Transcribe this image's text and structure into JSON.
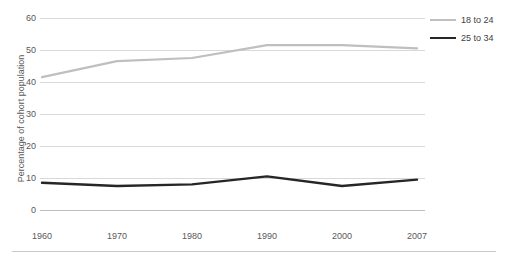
{
  "chart_data": {
    "type": "line",
    "title": "",
    "xlabel": "",
    "ylabel": "Percentage of cohort population",
    "x": [
      1960,
      1970,
      1980,
      1990,
      2000,
      2007
    ],
    "xticklabels": [
      "1960",
      "1970",
      "1980",
      "1990",
      "2000",
      "2007"
    ],
    "yticklabels": [
      "0",
      "10",
      "20",
      "30",
      "40",
      "50",
      "60"
    ],
    "yticks": [
      0,
      10,
      20,
      30,
      40,
      50,
      60
    ],
    "ylim": [
      0,
      60
    ],
    "grid": "horizontal",
    "legend_position": "top-right",
    "series": [
      {
        "name": "18 to 24",
        "color": "#bfbfbf",
        "values": [
          41.5,
          46.5,
          47.5,
          51.5,
          51.5,
          50.5
        ]
      },
      {
        "name": "25 to 34",
        "color": "#262626",
        "values": [
          8.5,
          7.5,
          8.0,
          10.5,
          7.5,
          9.5
        ]
      }
    ]
  },
  "legend": {
    "items": [
      {
        "label": "18 to 24",
        "color": "#bfbfbf"
      },
      {
        "label": "25 to 34",
        "color": "#262626"
      }
    ]
  },
  "colors": {
    "gridline": "#d9d9d9",
    "axis": "#bfbfbf",
    "text": "#595959",
    "background": "#ffffff",
    "rule": "#c8c8c8"
  }
}
